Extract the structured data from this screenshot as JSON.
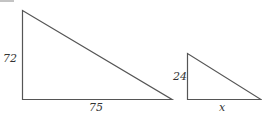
{
  "diagram": {
    "stroke_color": "#555555",
    "large_triangle": {
      "vertical_label": "72",
      "base_label": "75"
    },
    "small_triangle": {
      "vertical_label": "24",
      "base_label": "x"
    }
  }
}
